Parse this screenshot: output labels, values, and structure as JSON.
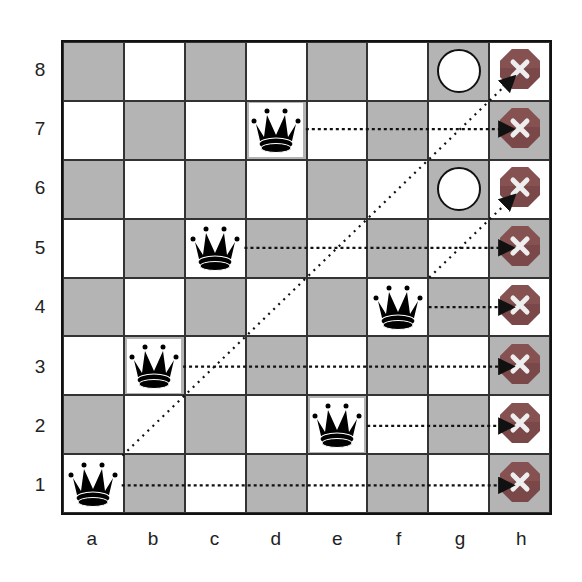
{
  "board": {
    "files": [
      "a",
      "b",
      "c",
      "d",
      "e",
      "f",
      "g",
      "h"
    ],
    "ranks": [
      "8",
      "7",
      "6",
      "5",
      "4",
      "3",
      "2",
      "1"
    ],
    "colors": {
      "light": "#ffffff",
      "dark": "#b4b4b4",
      "x_marker": "#7a3a3a"
    },
    "queens": [
      "a1",
      "b3",
      "c5",
      "d7",
      "e2",
      "f4"
    ],
    "safe_circles": [
      "g8",
      "g6"
    ],
    "blocked_markers": [
      "h8",
      "h7",
      "h6",
      "h5",
      "h4",
      "h3",
      "h2",
      "h1"
    ]
  },
  "arrows": [
    {
      "from": "a1",
      "to": "h8",
      "type": "diagonal"
    },
    {
      "from": "f4",
      "to": "h6",
      "type": "diagonal"
    },
    {
      "from": "d7",
      "to": "h7",
      "type": "horizontal"
    },
    {
      "from": "c5",
      "to": "h5",
      "type": "horizontal"
    },
    {
      "from": "f4",
      "to": "h4",
      "type": "horizontal"
    },
    {
      "from": "b3",
      "to": "h3",
      "type": "horizontal"
    },
    {
      "from": "e2",
      "to": "h2",
      "type": "horizontal"
    },
    {
      "from": "a1",
      "to": "h1",
      "type": "horizontal"
    }
  ]
}
